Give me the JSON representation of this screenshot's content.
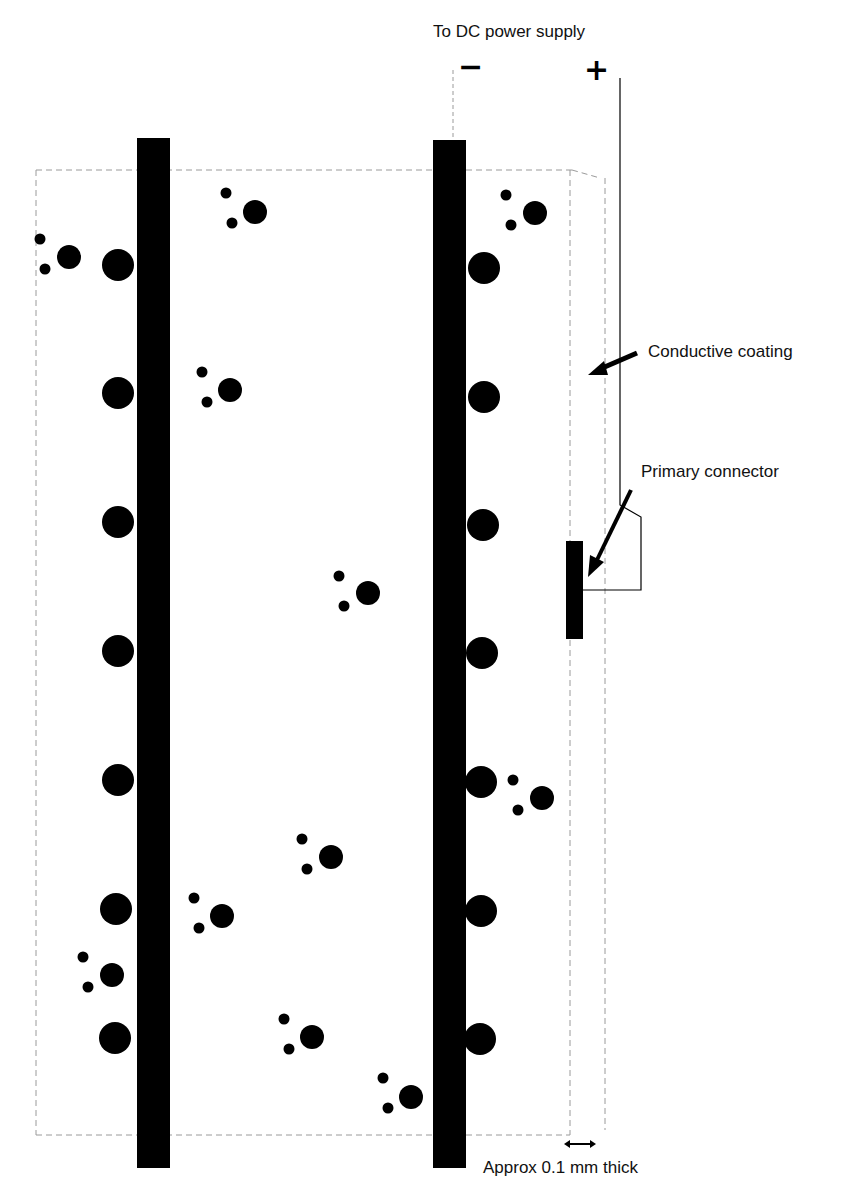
{
  "labels": {
    "power_supply": "To DC power supply",
    "negative": "−",
    "positive": "+",
    "conductive_coating": "Conductive coating",
    "primary_connector": "Primary connector",
    "thickness": "Approx 0.1 mm thick"
  },
  "colors": {
    "ink": "#000000",
    "faint_line": "#9a9a9a",
    "background": "#ffffff"
  },
  "geometry": {
    "bars": [
      {
        "x": 137,
        "y": 138,
        "w": 33,
        "h": 1030
      },
      {
        "x": 433,
        "y": 140,
        "w": 33,
        "h": 1028
      }
    ],
    "attached_dots_left": [
      265,
      393,
      522,
      651,
      780,
      909,
      1038
    ],
    "attached_dots_right": [
      268,
      397,
      525,
      653,
      782,
      911,
      1039
    ],
    "free_clusters": [
      {
        "x": 255,
        "y": 212
      },
      {
        "x": 69,
        "y": 257
      },
      {
        "x": 230,
        "y": 390
      },
      {
        "x": 368,
        "y": 593
      },
      {
        "x": 535,
        "y": 213
      },
      {
        "x": 542,
        "y": 798
      },
      {
        "x": 331,
        "y": 857
      },
      {
        "x": 222,
        "y": 916
      },
      {
        "x": 112,
        "y": 975
      },
      {
        "x": 312,
        "y": 1037
      },
      {
        "x": 411,
        "y": 1097
      }
    ]
  }
}
